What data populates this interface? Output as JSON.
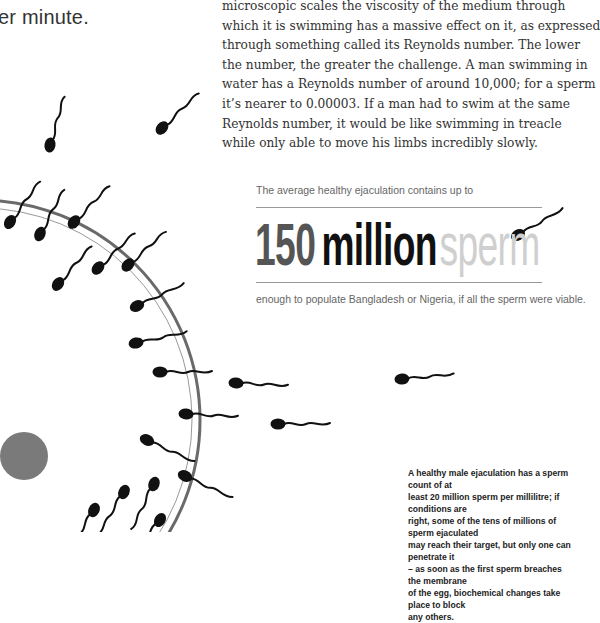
{
  "heading_fragment": "er minute.",
  "body_paragraph_lines": [
    "microscopic scales the viscosity of the medium through",
    "which it is swimming has a massive effect on it, as expressed",
    "through something called its Reynolds number. The lower",
    "the number, the greater the challenge. A man swimming in",
    "water has a Reynolds number of around 10,000; for a sperm",
    "it’s nearer to 0.00003. If a man had to swim at the same",
    "Reynolds number, it would be like swimming in treacle",
    "while only able to move his limbs incredibly slowly."
  ],
  "stat": {
    "intro": "The average healthy ejaculation contains up to",
    "number": "150",
    "unit": "million",
    "subject": "sperm",
    "outro": "enough to populate Bangladesh or Nigeria, if all the sperm were viable."
  },
  "caption_lines": [
    "A healthy male ejaculation has a sperm count of at",
    "least 20 million sperm per millilitre; if conditions are",
    "right, some of the tens of millions of sperm ejaculated",
    "may reach their target, but only one can penetrate it",
    "– as soon as the first sperm breaches the membrane",
    "of the egg, biochemical changes take place to block",
    "any others."
  ],
  "illustration": {
    "egg_outline_color": "#6a6a6a",
    "nucleus_color": "#7a7a7a",
    "sperm_color": "#111111"
  }
}
